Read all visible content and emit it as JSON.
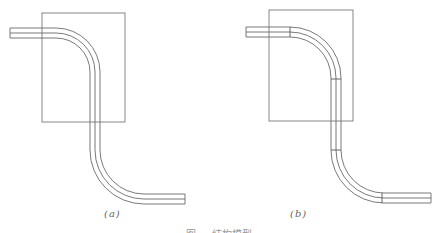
{
  "figure": {
    "panels": [
      {
        "id": "a",
        "label": "(a)",
        "description": "Single continuous S-bent pipe passing through rectangular region",
        "segment_dividers": 0
      },
      {
        "id": "b",
        "label": "(b)",
        "description": "S-bent pipe segmented into parts passing through rectangular region",
        "segment_dividers": 4
      }
    ],
    "caption": "图 … 结构模型"
  }
}
